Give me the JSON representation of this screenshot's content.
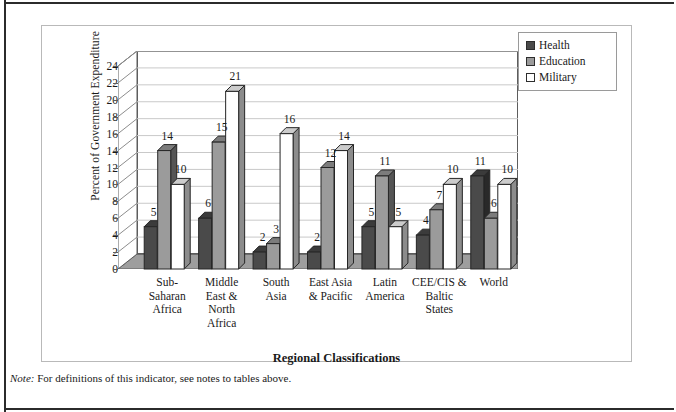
{
  "figure": {
    "note_prefix": "Note:",
    "note_text": "For definitions of this indicator, see notes to tables above."
  },
  "chart_data": {
    "type": "bar",
    "title": "",
    "xlabel": "Regional Classifications",
    "ylabel": "Percent of Government Expenditure",
    "ylim": [
      0,
      24
    ],
    "ytick_step": 2,
    "yticks": [
      "0",
      "2",
      "4",
      "6",
      "8",
      "10",
      "12",
      "14",
      "16",
      "18",
      "20",
      "22",
      "24"
    ],
    "grid": true,
    "legend_position": "top-right",
    "categories": [
      "Sub-\nSaharan\nAfrica",
      "Middle\nEast &\nNorth\nAfrica",
      "South\nAsia",
      "East Asia\n& Pacific",
      "Latin\nAmerica",
      "CEE/CIS &\nBaltic\nStates",
      "World"
    ],
    "series": [
      {
        "name": "Health",
        "color": "#4a4a4a",
        "values": [
          5,
          6,
          2,
          2,
          5,
          4,
          11
        ]
      },
      {
        "name": "Education",
        "color": "#9b9b9b",
        "values": [
          14,
          15,
          3,
          12,
          11,
          7,
          6
        ]
      },
      {
        "name": "Military",
        "color": "#ffffff",
        "values": [
          10,
          21,
          16,
          14,
          5,
          10,
          10
        ]
      }
    ]
  },
  "legend": {
    "items": [
      {
        "label": "Health"
      },
      {
        "label": "Education"
      },
      {
        "label": "Military"
      }
    ]
  }
}
